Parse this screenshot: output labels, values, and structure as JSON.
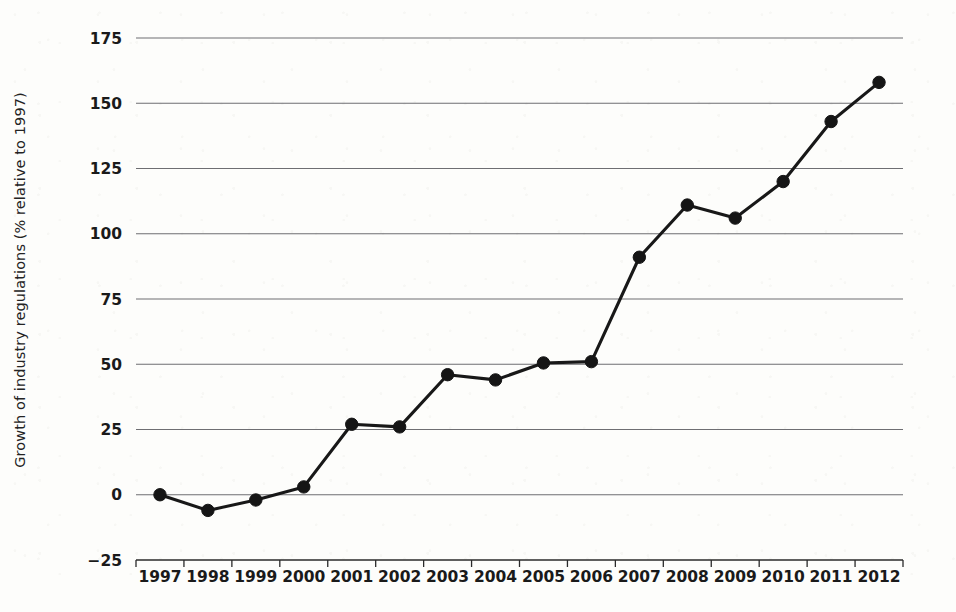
{
  "chart_data": {
    "type": "line",
    "title": "",
    "subtitle": "",
    "xlabel": "",
    "ylabel": "Growth of industry regulations (% relative to 1997)",
    "categories": [
      "1997",
      "1998",
      "1999",
      "2000",
      "2001",
      "2002",
      "2003",
      "2004",
      "2005",
      "2006",
      "2007",
      "2008",
      "2009",
      "2010",
      "2011",
      "2012"
    ],
    "x": [
      1997,
      1998,
      1999,
      2000,
      2001,
      2002,
      2003,
      2004,
      2005,
      2006,
      2007,
      2008,
      2009,
      2010,
      2011,
      2012
    ],
    "values": [
      0,
      -6,
      -2,
      3,
      27,
      26,
      46,
      44,
      50.5,
      51,
      91,
      111,
      106,
      120,
      143,
      158
    ],
    "series": [
      {
        "name": "Growth of industry regulations",
        "values": [
          0,
          -6,
          -2,
          3,
          27,
          26,
          46,
          44,
          50.5,
          51,
          91,
          111,
          106,
          120,
          143,
          158
        ]
      }
    ],
    "ylim": [
      -25,
      175
    ],
    "xlim_categories": [
      "1997",
      "2012"
    ],
    "yticks": [
      -25,
      0,
      25,
      50,
      75,
      100,
      125,
      150,
      175
    ],
    "ytick_labels": [
      "−25",
      "0",
      "25",
      "50",
      "75",
      "100",
      "125",
      "150",
      "175"
    ],
    "xtick_labels": [
      "1997",
      "1998",
      "1999",
      "2000",
      "2001",
      "2002",
      "2003",
      "2004",
      "2005",
      "2006",
      "2007",
      "2008",
      "2009",
      "2010",
      "2011",
      "2012"
    ],
    "grid": true,
    "grid_axis": "y",
    "legend": false,
    "legend_position": "none",
    "marker": "circle",
    "annotations": [],
    "colors": {
      "line": "#181818",
      "marker": "#151515",
      "grid": "#6e6e72",
      "axis": "#2a2a2a",
      "text": "#1a1a1a",
      "background": "#fdfdfb"
    }
  }
}
